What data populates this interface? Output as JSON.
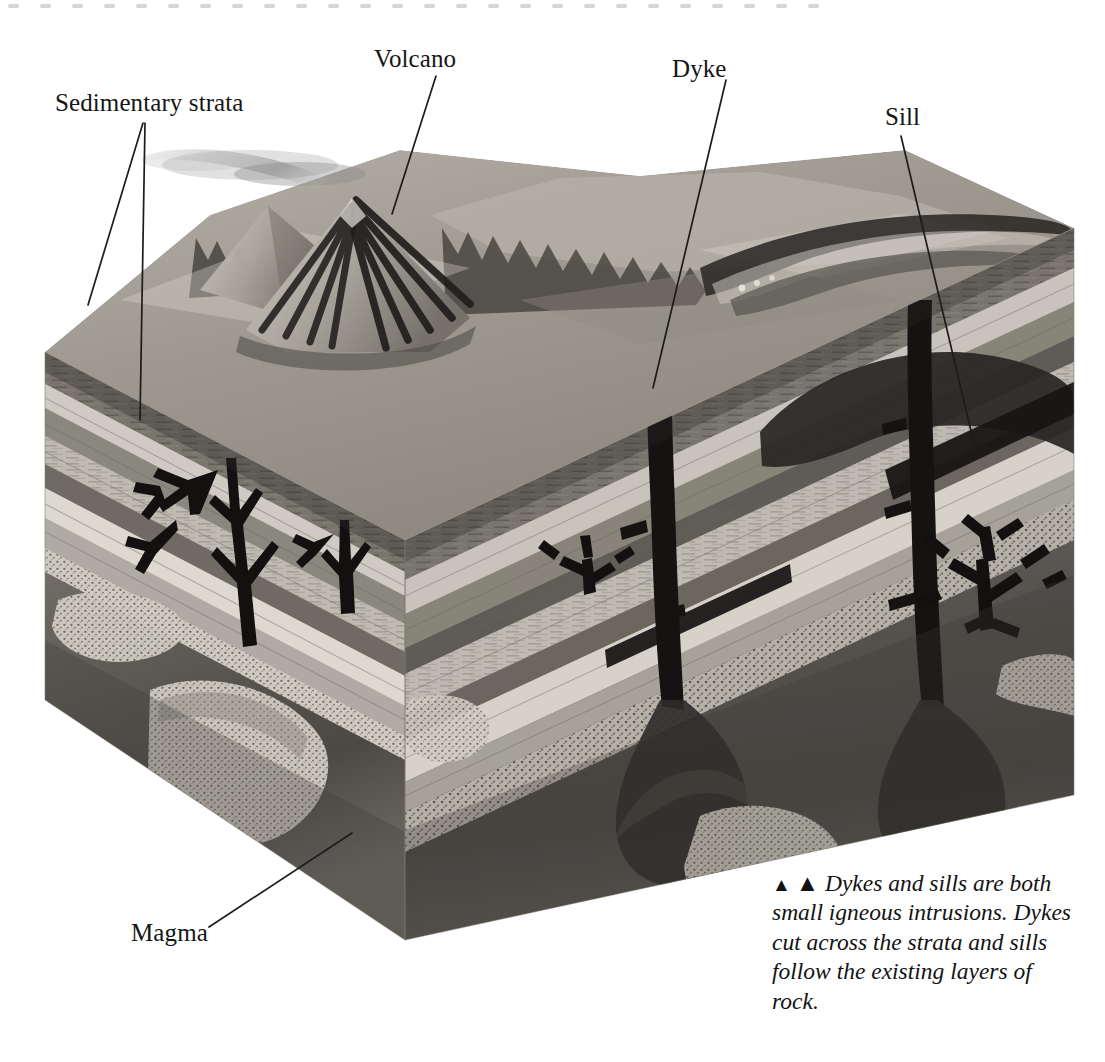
{
  "figure": {
    "kind": "geological-block-diagram",
    "background": "#ffffff"
  },
  "labels": [
    {
      "id": "sedimentary-strata",
      "text": "Sedimentary strata",
      "x": 55,
      "y": 90
    },
    {
      "id": "volcano",
      "text": "Volcano",
      "x": 374,
      "y": 46
    },
    {
      "id": "dyke",
      "text": "Dyke",
      "x": 672,
      "y": 56
    },
    {
      "id": "sill",
      "text": "Sill",
      "x": 885,
      "y": 104
    },
    {
      "id": "magma",
      "text": "Magma",
      "x": 131,
      "y": 920
    }
  ],
  "caption": {
    "marker": "▲",
    "lines": [
      "Dykes and sills are both",
      "small igneous intrusions.",
      "Dykes cut across the strata",
      "and sills follow the existing",
      "layers of rock."
    ],
    "full_text": "▲ Dykes and sills are both small igneous intrusions. Dykes cut across the strata and sills follow the existing layers of rock."
  },
  "leader_lines": [
    {
      "id": "leader-sedimentary-a",
      "from": [
        143,
        123
      ],
      "to": [
        88,
        305
      ]
    },
    {
      "id": "leader-sedimentary-b",
      "from": [
        145,
        123
      ],
      "to": [
        140,
        420
      ]
    },
    {
      "id": "leader-volcano",
      "from": [
        436,
        76
      ],
      "to": [
        392,
        214
      ]
    },
    {
      "id": "leader-dyke",
      "from": [
        726,
        80
      ],
      "to": [
        653,
        388
      ]
    },
    {
      "id": "leader-sill",
      "from": [
        901,
        136
      ],
      "to": [
        976,
        452
      ]
    },
    {
      "id": "leader-magma",
      "from": [
        209,
        927
      ],
      "to": [
        352,
        833
      ]
    }
  ],
  "colors": {
    "page_background": "#ffffff",
    "label_text": "#151515",
    "leader_line": "#1c1c1c",
    "edge_dot": "#d6d6da",
    "magma_dark": "#4a4a4a",
    "magma_deep": "#3a3a3a",
    "intrusion_black": "#141414",
    "strata_light": "#d8d5ce",
    "strata_mid": "#a8a49c",
    "strata_dark": "#6e6a63",
    "strata_pale": "#c6c2ba",
    "top_surface": "#9b968e",
    "sky": "#ffffff",
    "plume": "#b9b9b9"
  },
  "geometry": {
    "block": {
      "front_corner": [
        405,
        540
      ],
      "left_corner": [
        45,
        352
      ],
      "right_corner": [
        1074,
        228
      ],
      "bottom_front": [
        405,
        940
      ],
      "bottom_left": [
        45,
        700
      ],
      "bottom_right": [
        1074,
        795
      ]
    },
    "note": "Oblique 3-D cut block: left cut-face and right cut-face meet at a front vertical edge; landscape surface on top."
  },
  "features": {
    "volcano": {
      "summit": [
        352,
        196
      ],
      "has_plume": true,
      "plume_direction": "left"
    },
    "dykes": [
      {
        "id": "dyke-front-left",
        "top": [
          352,
          215
        ],
        "bottom": [
          352,
          560
        ],
        "face": "left"
      },
      {
        "id": "dyke-right-inner",
        "top": [
          640,
          320
        ],
        "bottom": [
          660,
          700
        ],
        "face": "right"
      },
      {
        "id": "dyke-right-outer",
        "top": [
          915,
          300
        ],
        "bottom": [
          930,
          700
        ],
        "face": "right"
      }
    ],
    "sills": [
      {
        "id": "sill-right",
        "y": 455,
        "x_from": 900,
        "x_to": 1074,
        "face": "right"
      },
      {
        "id": "sill-mid",
        "y": 492,
        "x_from": 620,
        "x_to": 790,
        "face": "right"
      }
    ],
    "magma_chamber": {
      "top": 560,
      "bottom": 940,
      "description": "dark gradient body spanning both cut faces"
    },
    "strata_bands_left": 8,
    "strata_bands_right": 9
  },
  "edge_dots": {
    "count": 26,
    "spacing": 32,
    "y": 4
  }
}
